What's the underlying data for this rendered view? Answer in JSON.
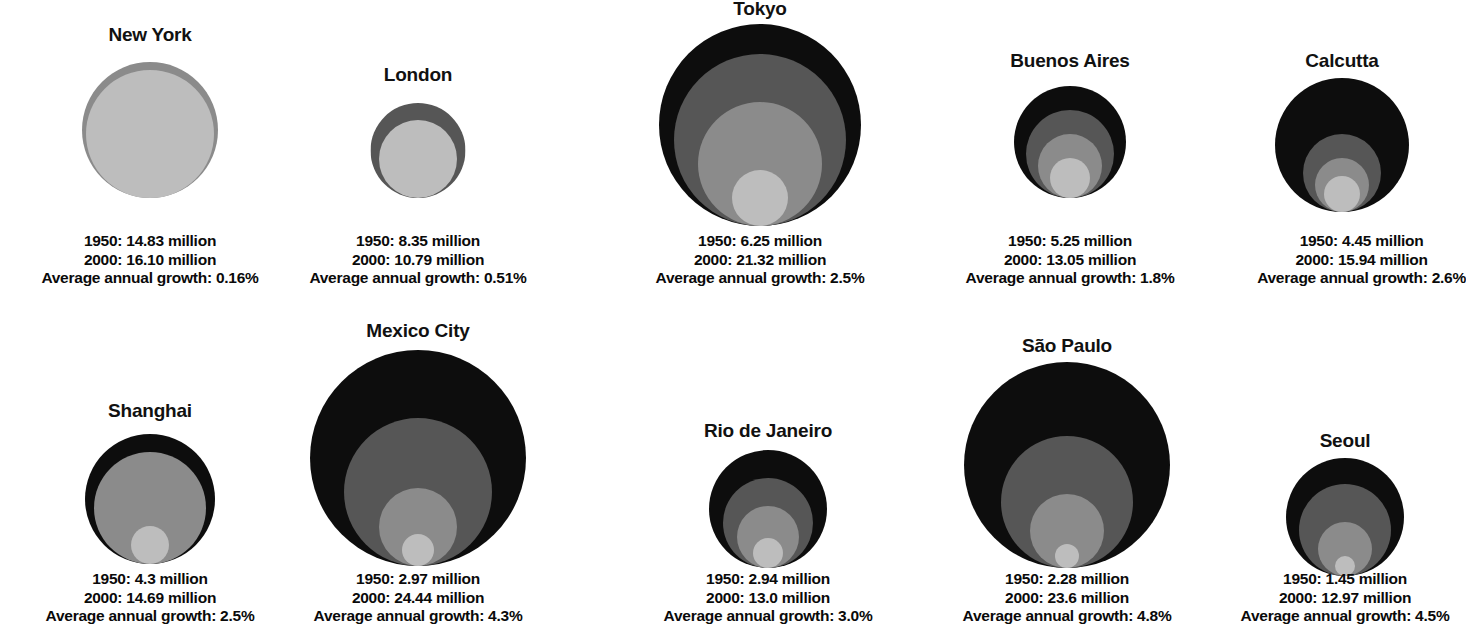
{
  "legend": {
    "year_1950_label": "1950",
    "year_2000_label": "2000",
    "growth_label": "Average annual growth",
    "unit": "million"
  },
  "palette": {
    "outer_black": "#0d0d0d",
    "dark_gray": "#565656",
    "mid_gray": "#8b8b8b",
    "light_gray": "#bdbdbd",
    "background": "#ffffff",
    "text": "#0a0a0a"
  },
  "chart_data": {
    "type": "bubble",
    "title": "",
    "subtitle": "",
    "xlabel": "",
    "ylabel": "",
    "grid": false,
    "legend_position": "none",
    "encoding": "Nested circles: outer circle area = 2000 population, innermost light circle area = 1950 population; intermediate rings mark interpolated growth stages. Circles are bottom-aligned within each panel.",
    "series": [
      {
        "name": "New York",
        "pop_1950": 14.83,
        "pop_2000": 16.1,
        "growth_pct": 0.16,
        "rings": 2,
        "line_1950": "1950: 14.83 million",
        "line_2000": "2000: 16.10 million",
        "line_growth": "Average annual growth: 0.16%"
      },
      {
        "name": "London",
        "pop_1950": 8.35,
        "pop_2000": 10.79,
        "growth_pct": 0.51,
        "rings": 2,
        "line_1950": "1950: 8.35 million",
        "line_2000": "2000: 10.79 million",
        "line_growth": "Average annual growth: 0.51%"
      },
      {
        "name": "Tokyo",
        "pop_1950": 6.25,
        "pop_2000": 21.32,
        "growth_pct": 2.5,
        "rings": 3,
        "line_1950": "1950: 6.25 million",
        "line_2000": "2000: 21.32 million",
        "line_growth": "Average annual growth: 2.5%"
      },
      {
        "name": "Buenos Aires",
        "pop_1950": 5.25,
        "pop_2000": 13.05,
        "growth_pct": 1.8,
        "rings": 3,
        "line_1950": "1950: 5.25 million",
        "line_2000": "2000: 13.05 million",
        "line_growth": "Average annual growth: 1.8%"
      },
      {
        "name": "Calcutta",
        "pop_1950": 4.45,
        "pop_2000": 15.94,
        "growth_pct": 2.6,
        "rings": 3,
        "line_1950": "1950: 4.45 million",
        "line_2000": "2000: 15.94 million",
        "line_growth": "Average annual growth: 2.6%"
      },
      {
        "name": "Shanghai",
        "pop_1950": 4.3,
        "pop_2000": 14.69,
        "growth_pct": 2.5,
        "rings": 3,
        "line_1950": "1950: 4.3 million",
        "line_2000": "2000: 14.69 million",
        "line_growth": "Average annual growth: 2.5%"
      },
      {
        "name": "Mexico City",
        "pop_1950": 2.97,
        "pop_2000": 24.44,
        "growth_pct": 4.3,
        "rings": 4,
        "line_1950": "1950: 2.97 million",
        "line_2000": "2000: 24.44 million",
        "line_growth": "Average annual growth: 4.3%"
      },
      {
        "name": "Rio de Janeiro",
        "pop_1950": 2.94,
        "pop_2000": 13.0,
        "growth_pct": 3.0,
        "rings": 4,
        "line_1950": "1950: 2.94 million",
        "line_2000": "2000: 13.0 million",
        "line_growth": "Average annual growth: 3.0%"
      },
      {
        "name": "São Paulo",
        "pop_1950": 2.28,
        "pop_2000": 23.6,
        "growth_pct": 4.8,
        "rings": 4,
        "line_1950": "1950: 2.28 million",
        "line_2000": "2000: 23.6 million",
        "line_growth": "Average annual growth: 4.8%"
      },
      {
        "name": "Seoul",
        "pop_1950": 1.45,
        "pop_2000": 12.97,
        "growth_pct": 4.5,
        "rings": 4,
        "line_1950": "1950: 1.45 million",
        "line_2000": "2000: 12.97 million",
        "line_growth": "Average annual growth: 4.5%"
      }
    ]
  },
  "layout": {
    "panels": [
      {
        "index": 0,
        "left": 0,
        "top": 24,
        "width": 300,
        "title_top": 24,
        "bubble_top": 62,
        "caption_top": 232,
        "outer_d": 136,
        "circles": [
          {
            "d": 136,
            "tone": "mid_gray"
          },
          {
            "d": 128,
            "tone": "light_gray"
          }
        ]
      },
      {
        "index": 1,
        "left": 275,
        "top": 64,
        "width": 286,
        "title_top": 64,
        "bubble_top": 103,
        "caption_top": 232,
        "outer_d": 95,
        "circles": [
          {
            "d": 95,
            "tone": "dark_gray"
          },
          {
            "d": 78,
            "tone": "light_gray"
          }
        ]
      },
      {
        "index": 2,
        "left": 610,
        "top": -2,
        "width": 300,
        "title_top": -2,
        "bubble_top": 24,
        "caption_top": 232,
        "outer_d": 202,
        "circles": [
          {
            "d": 202,
            "tone": "outer_black"
          },
          {
            "d": 172,
            "tone": "dark_gray"
          },
          {
            "d": 124,
            "tone": "mid_gray"
          },
          {
            "d": 56,
            "tone": "light_gray"
          }
        ]
      },
      {
        "index": 3,
        "left": 930,
        "top": 50,
        "width": 280,
        "title_top": 50,
        "bubble_top": 86,
        "caption_top": 232,
        "outer_d": 112,
        "circles": [
          {
            "d": 112,
            "tone": "outer_black"
          },
          {
            "d": 88,
            "tone": "dark_gray"
          },
          {
            "d": 64,
            "tone": "mid_gray"
          },
          {
            "d": 40,
            "tone": "light_gray"
          }
        ]
      },
      {
        "index": 4,
        "left": 1222,
        "top": 50,
        "width": 240,
        "title_top": 50,
        "bubble_top": 78,
        "caption_top": 232,
        "outer_d": 134,
        "circles": [
          {
            "d": 134,
            "tone": "outer_black"
          },
          {
            "d": 78,
            "tone": "dark_gray"
          },
          {
            "d": 54,
            "tone": "mid_gray"
          },
          {
            "d": 36,
            "tone": "light_gray"
          }
        ]
      },
      {
        "index": 5,
        "left": 0,
        "top": 400,
        "width": 300,
        "title_top": 400,
        "bubble_top": 434,
        "caption_top": 570,
        "outer_d": 130,
        "circles": [
          {
            "d": 130,
            "tone": "outer_black"
          },
          {
            "d": 112,
            "tone": "mid_gray"
          },
          {
            "d": 38,
            "tone": "light_gray"
          }
        ]
      },
      {
        "index": 6,
        "left": 268,
        "top": 320,
        "width": 300,
        "title_top": 320,
        "bubble_top": 350,
        "caption_top": 570,
        "outer_d": 216,
        "circles": [
          {
            "d": 216,
            "tone": "outer_black"
          },
          {
            "d": 148,
            "tone": "dark_gray"
          },
          {
            "d": 78,
            "tone": "mid_gray"
          },
          {
            "d": 32,
            "tone": "light_gray"
          }
        ]
      },
      {
        "index": 7,
        "left": 618,
        "top": 420,
        "width": 300,
        "title_top": 420,
        "bubble_top": 450,
        "caption_top": 570,
        "outer_d": 118,
        "circles": [
          {
            "d": 118,
            "tone": "outer_black"
          },
          {
            "d": 90,
            "tone": "dark_gray"
          },
          {
            "d": 62,
            "tone": "mid_gray"
          },
          {
            "d": 30,
            "tone": "light_gray"
          }
        ]
      },
      {
        "index": 8,
        "left": 922,
        "top": 335,
        "width": 290,
        "title_top": 335,
        "bubble_top": 362,
        "caption_top": 570,
        "outer_d": 206,
        "circles": [
          {
            "d": 206,
            "tone": "outer_black"
          },
          {
            "d": 132,
            "tone": "dark_gray"
          },
          {
            "d": 74,
            "tone": "mid_gray"
          },
          {
            "d": 24,
            "tone": "light_gray"
          }
        ]
      },
      {
        "index": 9,
        "left": 1232,
        "top": 430,
        "width": 226,
        "title_top": 430,
        "bubble_top": 458,
        "caption_top": 570,
        "outer_d": 118,
        "circles": [
          {
            "d": 118,
            "tone": "outer_black"
          },
          {
            "d": 92,
            "tone": "dark_gray"
          },
          {
            "d": 54,
            "tone": "mid_gray"
          },
          {
            "d": 20,
            "tone": "light_gray"
          }
        ]
      }
    ]
  }
}
